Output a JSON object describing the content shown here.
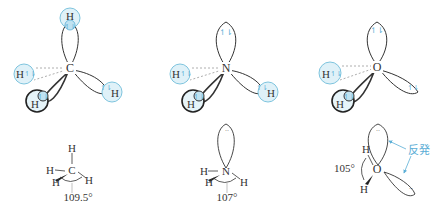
{
  "colors": {
    "h_orbital_fill": "#dff1f8",
    "h_orbital_stroke": "#7ec4de",
    "electron_arrow": "#5aaed6",
    "lobe_stroke": "#333333",
    "annotation": "#5aaed6"
  },
  "molecules": [
    {
      "name": "methane",
      "center_atom": "C",
      "hydrogens": [
        "H",
        "H",
        "H",
        "H"
      ],
      "electron_pair_glyph": "↿⇂",
      "bond_angle": "109.5°",
      "structure_labels": {
        "center": "C",
        "top": "H",
        "left": "H",
        "front": "H",
        "right": "H"
      }
    },
    {
      "name": "ammonia",
      "center_atom": "N",
      "hydrogens": [
        "H",
        "H",
        "H"
      ],
      "electron_pair_glyph": "↿⇂",
      "bond_angle": "107°",
      "structure_labels": {
        "center": "N",
        "left": "H",
        "front": "H",
        "right": "H"
      }
    },
    {
      "name": "water",
      "center_atom": "O",
      "hydrogens": [
        "H",
        "H"
      ],
      "electron_pair_glyph": "↿⇂",
      "bond_angle": "105°",
      "structure_labels": {
        "center": "O",
        "top": "H",
        "bottom": "H"
      },
      "annotation": "反発"
    }
  ]
}
